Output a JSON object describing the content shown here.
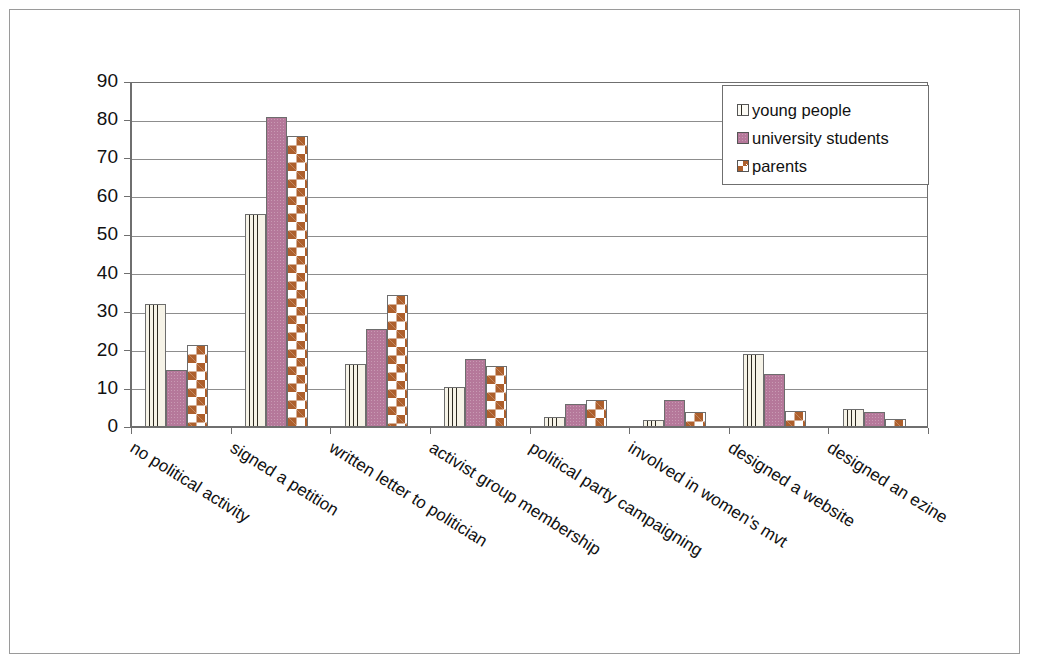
{
  "chart_data": {
    "type": "bar",
    "title": "",
    "xlabel": "",
    "ylabel": "",
    "ylim": [
      0,
      90
    ],
    "y_ticks": [
      0,
      10,
      20,
      30,
      40,
      50,
      60,
      70,
      80,
      90
    ],
    "grid": true,
    "legend_position": "top-right",
    "categories": [
      "no political activity",
      "signed a petition",
      "written letter to politician",
      "activist group membership",
      "political party campaigning",
      "involved in women's mvt",
      "designed a website",
      "designed an ezine"
    ],
    "series": [
      {
        "name": "young people",
        "color": "#f6f3e7",
        "pattern": "vertical-stripes",
        "values": [
          32,
          55.5,
          16.5,
          10.5,
          2.5,
          1.8,
          19,
          4.7
        ]
      },
      {
        "name": "university students",
        "color": "#b5789a",
        "pattern": "solid",
        "values": [
          15,
          81,
          25.5,
          17.8,
          6,
          7,
          13.7,
          4
        ]
      },
      {
        "name": "parents",
        "color": "#ad5f2c",
        "pattern": "diamonds",
        "values": [
          21.5,
          76,
          34.5,
          16,
          7,
          4,
          4.3,
          2.2
        ]
      }
    ]
  },
  "legend": {
    "items": [
      {
        "label": "young people"
      },
      {
        "label": "university students"
      },
      {
        "label": "parents"
      }
    ]
  },
  "axis": {
    "y_labels": [
      "90",
      "80",
      "70",
      "60",
      "50",
      "40",
      "30",
      "20",
      "10",
      "0"
    ]
  }
}
